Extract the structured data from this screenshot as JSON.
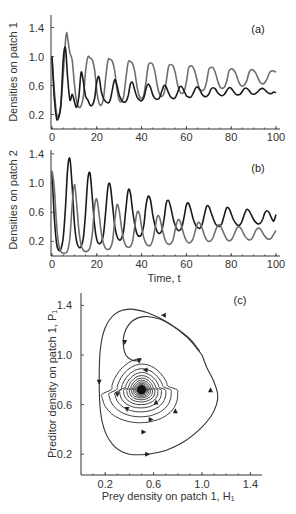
{
  "chart_data": [
    {
      "id": "a",
      "type": "line",
      "panel_label": "(a)",
      "title": "",
      "xlabel": "",
      "ylabel": "Densities on patch 1",
      "xlim": [
        0,
        100
      ],
      "ylim": [
        0,
        1.5
      ],
      "xticks": [
        0,
        20,
        40,
        60,
        80,
        100
      ],
      "xtick_labels": [
        "0",
        "20",
        "40",
        "60",
        "80",
        "100"
      ],
      "yticks": [
        0.2,
        0.6,
        1.0,
        1.4
      ],
      "ytick_labels": [
        "0.2",
        "0.6",
        "1.0",
        "1.4"
      ],
      "grid": false,
      "legend": "none",
      "series": [
        {
          "name": "Prey H1",
          "color": "#6e6e6e",
          "x": [
            0,
            1,
            2,
            3,
            4,
            5,
            6,
            6.5,
            7,
            8,
            9,
            10,
            11,
            12,
            13,
            14,
            15,
            16,
            17,
            18,
            19,
            20,
            21,
            22,
            23,
            24,
            25,
            26,
            27,
            28,
            29,
            30,
            31,
            32,
            33,
            34,
            35,
            36,
            37,
            38,
            39,
            40,
            41,
            42,
            43,
            44,
            45,
            46,
            47,
            48,
            49,
            50,
            51,
            52,
            53,
            54,
            55,
            56,
            57,
            58,
            59,
            60,
            61,
            62,
            63,
            64,
            65,
            66,
            67,
            68,
            69,
            70,
            71,
            72,
            73,
            74,
            75,
            76,
            77,
            78,
            79,
            80,
            81,
            82,
            83,
            84,
            85,
            86,
            87,
            88,
            89,
            90,
            91,
            92,
            93,
            94,
            95,
            96,
            97,
            98,
            99,
            100
          ],
          "y": [
            0.98,
            0.55,
            0.22,
            0.18,
            0.35,
            0.75,
            1.2,
            1.33,
            1.25,
            1.05,
            0.95,
            0.62,
            0.38,
            0.3,
            0.32,
            0.45,
            0.8,
            0.99,
            0.98,
            0.95,
            0.82,
            0.52,
            0.36,
            0.33,
            0.42,
            0.72,
            0.95,
            0.96,
            0.93,
            0.8,
            0.55,
            0.4,
            0.38,
            0.45,
            0.7,
            0.92,
            0.93,
            0.9,
            0.78,
            0.58,
            0.45,
            0.42,
            0.47,
            0.66,
            0.88,
            0.91,
            0.89,
            0.78,
            0.6,
            0.48,
            0.45,
            0.49,
            0.65,
            0.86,
            0.89,
            0.87,
            0.78,
            0.62,
            0.52,
            0.49,
            0.52,
            0.65,
            0.84,
            0.87,
            0.85,
            0.77,
            0.64,
            0.55,
            0.53,
            0.55,
            0.65,
            0.82,
            0.85,
            0.84,
            0.77,
            0.66,
            0.58,
            0.56,
            0.58,
            0.66,
            0.8,
            0.83,
            0.82,
            0.77,
            0.68,
            0.61,
            0.59,
            0.61,
            0.67,
            0.78,
            0.82,
            0.81,
            0.77,
            0.7,
            0.64,
            0.62,
            0.64,
            0.69,
            0.77,
            0.8,
            0.8,
            0.78
          ]
        },
        {
          "name": "Predator P1",
          "color": "#1a1a1a",
          "x": [
            0,
            1,
            2,
            3,
            4,
            5,
            6,
            7,
            8,
            9,
            10,
            11,
            12,
            13,
            14,
            15,
            16,
            17,
            18,
            19,
            20,
            21,
            22,
            23,
            24,
            25,
            26,
            27,
            28,
            29,
            30,
            31,
            32,
            33,
            34,
            35,
            36,
            37,
            38,
            39,
            40,
            41,
            42,
            43,
            44,
            45,
            46,
            47,
            48,
            49,
            50,
            51,
            52,
            53,
            54,
            55,
            56,
            57,
            58,
            59,
            60,
            61,
            62,
            63,
            64,
            65,
            66,
            67,
            68,
            69,
            70,
            71,
            72,
            73,
            74,
            75,
            76,
            77,
            78,
            79,
            80,
            81,
            82,
            83,
            84,
            85,
            86,
            87,
            88,
            89,
            90,
            91,
            92,
            93,
            94,
            95,
            96,
            97,
            98,
            99,
            100
          ],
          "y": [
            1.0,
            0.45,
            0.15,
            0.16,
            0.35,
            0.95,
            1.12,
            0.7,
            0.4,
            0.48,
            0.38,
            0.3,
            0.45,
            0.78,
            0.65,
            0.45,
            0.4,
            0.33,
            0.33,
            0.42,
            0.65,
            0.72,
            0.52,
            0.42,
            0.38,
            0.36,
            0.4,
            0.55,
            0.68,
            0.6,
            0.47,
            0.4,
            0.37,
            0.38,
            0.46,
            0.62,
            0.64,
            0.53,
            0.44,
            0.4,
            0.39,
            0.43,
            0.56,
            0.62,
            0.57,
            0.47,
            0.42,
            0.41,
            0.43,
            0.52,
            0.6,
            0.58,
            0.5,
            0.44,
            0.42,
            0.43,
            0.5,
            0.58,
            0.58,
            0.52,
            0.46,
            0.44,
            0.44,
            0.49,
            0.56,
            0.58,
            0.54,
            0.48,
            0.45,
            0.45,
            0.48,
            0.55,
            0.57,
            0.55,
            0.5,
            0.47,
            0.46,
            0.48,
            0.53,
            0.57,
            0.56,
            0.52,
            0.48,
            0.47,
            0.48,
            0.52,
            0.56,
            0.56,
            0.53,
            0.49,
            0.48,
            0.49,
            0.52,
            0.55,
            0.56,
            0.54,
            0.51,
            0.49,
            0.49,
            0.51,
            0.5
          ]
        }
      ]
    },
    {
      "id": "b",
      "type": "line",
      "panel_label": "(b)",
      "title": "",
      "xlabel": "Time, t",
      "ylabel": "Densities on patch 2",
      "xlim": [
        0,
        100
      ],
      "ylim": [
        0,
        1.5
      ],
      "xticks": [
        0,
        20,
        40,
        60,
        80,
        100
      ],
      "xtick_labels": [
        "0",
        "20",
        "40",
        "60",
        "80",
        "100"
      ],
      "yticks": [
        0.2,
        0.6,
        1.0,
        1.4
      ],
      "ytick_labels": [
        "0.2",
        "0.6",
        "1.0",
        "1.4"
      ],
      "grid": false,
      "legend": "none",
      "series": [
        {
          "name": "Prey H2",
          "color": "#1a1a1a",
          "x": [
            0,
            1,
            2,
            3,
            4,
            5,
            6,
            7,
            8,
            9,
            10,
            11,
            12,
            13,
            14,
            15,
            16,
            17,
            18,
            19,
            20,
            21,
            22,
            23,
            24,
            25,
            26,
            27,
            28,
            29,
            30,
            31,
            32,
            33,
            34,
            35,
            36,
            37,
            38,
            39,
            40,
            41,
            42,
            43,
            44,
            45,
            46,
            47,
            48,
            49,
            50,
            51,
            52,
            53,
            54,
            55,
            56,
            57,
            58,
            59,
            60,
            61,
            62,
            63,
            64,
            65,
            66,
            67,
            68,
            69,
            70,
            71,
            72,
            73,
            74,
            75,
            76,
            77,
            78,
            79,
            80,
            81,
            82,
            83,
            84,
            85,
            86,
            87,
            88,
            89,
            90,
            91,
            92,
            93,
            94,
            95,
            96,
            97,
            98,
            99,
            100
          ],
          "y": [
            1.15,
            0.55,
            0.18,
            0.08,
            0.1,
            0.25,
            0.65,
            1.2,
            1.33,
            0.95,
            0.45,
            0.2,
            0.12,
            0.13,
            0.25,
            0.6,
            1.05,
            1.13,
            0.8,
            0.42,
            0.22,
            0.17,
            0.19,
            0.3,
            0.62,
            0.95,
            0.97,
            0.7,
            0.42,
            0.27,
            0.22,
            0.24,
            0.35,
            0.65,
            0.9,
            0.86,
            0.62,
            0.42,
            0.3,
            0.27,
            0.3,
            0.42,
            0.7,
            0.82,
            0.76,
            0.56,
            0.42,
            0.33,
            0.31,
            0.35,
            0.5,
            0.72,
            0.76,
            0.67,
            0.52,
            0.42,
            0.36,
            0.35,
            0.4,
            0.54,
            0.7,
            0.72,
            0.63,
            0.51,
            0.43,
            0.39,
            0.38,
            0.43,
            0.56,
            0.68,
            0.68,
            0.6,
            0.51,
            0.44,
            0.41,
            0.41,
            0.46,
            0.57,
            0.66,
            0.65,
            0.58,
            0.5,
            0.45,
            0.42,
            0.43,
            0.49,
            0.58,
            0.64,
            0.62,
            0.56,
            0.5,
            0.46,
            0.44,
            0.45,
            0.5,
            0.59,
            0.62,
            0.59,
            0.52,
            0.48,
            0.57
          ]
        },
        {
          "name": "Predator P2",
          "color": "#6e6e6e",
          "x": [
            0,
            1,
            2,
            3,
            4,
            5,
            6,
            7,
            8,
            9,
            10,
            11,
            12,
            13,
            14,
            15,
            16,
            17,
            18,
            19,
            20,
            21,
            22,
            23,
            24,
            25,
            26,
            27,
            28,
            29,
            30,
            31,
            32,
            33,
            34,
            35,
            36,
            37,
            38,
            39,
            40,
            41,
            42,
            43,
            44,
            45,
            46,
            47,
            48,
            49,
            50,
            51,
            52,
            53,
            54,
            55,
            56,
            57,
            58,
            59,
            60,
            61,
            62,
            63,
            64,
            65,
            66,
            67,
            68,
            69,
            70,
            71,
            72,
            73,
            74,
            75,
            76,
            77,
            78,
            79,
            80,
            81,
            82,
            83,
            84,
            85,
            86,
            87,
            88,
            89,
            90,
            91,
            92,
            93,
            94,
            95,
            96,
            97,
            98,
            99,
            100
          ],
          "y": [
            1.17,
            0.95,
            0.45,
            0.15,
            0.06,
            0.04,
            0.04,
            0.08,
            0.25,
            0.7,
            0.98,
            0.72,
            0.35,
            0.15,
            0.08,
            0.06,
            0.07,
            0.12,
            0.3,
            0.68,
            0.78,
            0.58,
            0.32,
            0.17,
            0.1,
            0.09,
            0.11,
            0.2,
            0.48,
            0.7,
            0.62,
            0.4,
            0.22,
            0.14,
            0.12,
            0.13,
            0.2,
            0.42,
            0.6,
            0.58,
            0.4,
            0.25,
            0.17,
            0.14,
            0.15,
            0.22,
            0.38,
            0.54,
            0.53,
            0.4,
            0.27,
            0.19,
            0.16,
            0.17,
            0.22,
            0.36,
            0.48,
            0.49,
            0.39,
            0.28,
            0.21,
            0.18,
            0.19,
            0.24,
            0.35,
            0.45,
            0.45,
            0.38,
            0.29,
            0.22,
            0.2,
            0.21,
            0.26,
            0.35,
            0.42,
            0.42,
            0.36,
            0.29,
            0.23,
            0.21,
            0.22,
            0.27,
            0.35,
            0.4,
            0.39,
            0.34,
            0.28,
            0.24,
            0.22,
            0.23,
            0.28,
            0.35,
            0.38,
            0.37,
            0.32,
            0.27,
            0.24,
            0.23,
            0.25,
            0.3,
            0.35
          ]
        }
      ]
    },
    {
      "id": "c",
      "type": "line",
      "panel_label": "(c)",
      "title": "",
      "xlabel": "Prey density on patch 1, H₁",
      "ylabel": "Preditor density on patch 1, P₁",
      "xlim": [
        0,
        1.55
      ],
      "ylim": [
        0,
        1.5
      ],
      "xticks": [
        0.2,
        0.6,
        1.0,
        1.4
      ],
      "xtick_labels": [
        "0.2",
        "0.6",
        "1.0",
        "1.4"
      ],
      "yticks": [
        0.2,
        0.6,
        1.0,
        1.4
      ],
      "ytick_labels": [
        "0.2",
        "0.6",
        "1.0",
        "1.4"
      ],
      "grid": false,
      "legend": "none",
      "equilibrium": [
        0.5,
        0.72
      ],
      "series": [
        {
          "name": "Phase trajectory",
          "color": "#333333",
          "x": [
            0.98,
            0.9,
            0.78,
            0.65,
            0.52,
            0.42,
            0.36,
            0.35,
            0.37,
            0.42,
            0.48
          ],
          "y": [
            1.03,
            1.13,
            1.22,
            1.29,
            1.31,
            1.27,
            1.18,
            1.08,
            1.0,
            0.96,
            0.95
          ]
        },
        {
          "name": "Outer loop",
          "color": "#333333",
          "x": [
            1.0,
            0.88,
            0.72,
            0.55,
            0.4,
            0.28,
            0.2,
            0.16,
            0.15,
            0.16,
            0.2,
            0.28,
            0.4,
            0.55,
            0.7,
            0.85,
            0.98,
            1.07,
            1.12,
            1.13,
            1.1,
            1.04,
            1.0
          ],
          "y": [
            1.0,
            1.14,
            1.26,
            1.34,
            1.37,
            1.33,
            1.22,
            1.05,
            0.8,
            0.55,
            0.38,
            0.26,
            0.2,
            0.2,
            0.23,
            0.3,
            0.4,
            0.5,
            0.6,
            0.68,
            0.78,
            0.9,
            1.0
          ]
        }
      ],
      "spiral": {
        "center": [
          0.5,
          0.72
        ],
        "start_radius_x": 0.31,
        "start_radius_y": 0.28,
        "decay_per_turn": 0.82,
        "turns": 16
      },
      "arrows": [
        {
          "x": 0.68,
          "y": 1.32,
          "dir": "left"
        },
        {
          "x": 0.15,
          "y": 0.78,
          "dir": "down"
        },
        {
          "x": 0.55,
          "y": 0.2,
          "dir": "right"
        },
        {
          "x": 1.07,
          "y": 0.72,
          "dir": "up"
        },
        {
          "x": 0.36,
          "y": 1.1,
          "dir": "down"
        },
        {
          "x": 0.48,
          "y": 0.95,
          "dir": "down"
        },
        {
          "x": 0.3,
          "y": 0.68,
          "dir": "down"
        },
        {
          "x": 0.52,
          "y": 0.38,
          "dir": "right"
        },
        {
          "x": 0.78,
          "y": 0.55,
          "dir": "up"
        },
        {
          "x": 0.53,
          "y": 0.88,
          "dir": "left"
        },
        {
          "x": 0.38,
          "y": 0.56,
          "dir": "down"
        },
        {
          "x": 0.62,
          "y": 0.62,
          "dir": "up"
        },
        {
          "x": 0.58,
          "y": 0.48,
          "dir": "right"
        }
      ]
    }
  ]
}
